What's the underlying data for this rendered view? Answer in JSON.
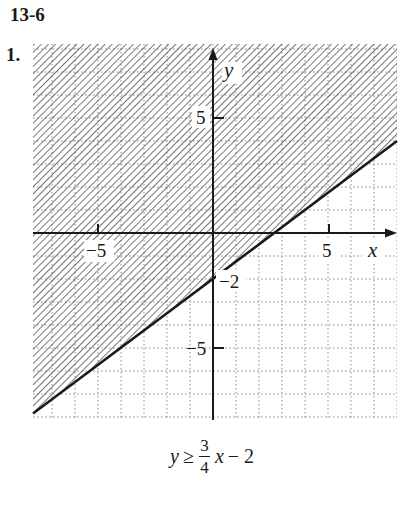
{
  "header": {
    "section": "13-6",
    "problem_number": "1."
  },
  "equation": {
    "lhs": "y",
    "relation": "≥",
    "numerator": "3",
    "denominator": "4",
    "variable": "x",
    "rest": "− 2"
  },
  "chart_data": {
    "type": "line",
    "xlabel": "x",
    "ylabel": "y",
    "xlim": [
      -7.8,
      8.0
    ],
    "ylim": [
      -8.1,
      8.2
    ],
    "grid": true,
    "grid_step": 1,
    "x_ticks": [
      {
        "value": -5,
        "label": "−5"
      },
      {
        "value": 5,
        "label": "5"
      }
    ],
    "y_ticks": [
      {
        "value": 5,
        "label": "5"
      },
      {
        "value": -5,
        "label": "−5"
      }
    ],
    "annotations": [
      {
        "x": 0,
        "y": -2,
        "label": "−2"
      }
    ],
    "series": [
      {
        "name": "boundary y = 3/4 x − 2",
        "slope": 0.75,
        "intercept": -2,
        "style": "solid",
        "x": [
          -7.8,
          8.0
        ],
        "y": [
          -7.85,
          4.0
        ]
      }
    ],
    "shaded_region": "above line (y ≥ 3/4 x − 2), diagonal hatch"
  },
  "colors": {
    "ink": "#1a1a1a",
    "grid": "#8a8a8a",
    "hatch": "#555555"
  }
}
